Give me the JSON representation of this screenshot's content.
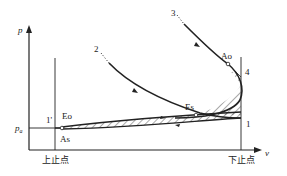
{
  "diagram": {
    "type": "p-v indicator diagram (engine gas exchange)",
    "axes": {
      "y_label": "p",
      "x_label": "v"
    },
    "reference_lines": {
      "pressure_level": "p_a",
      "tdc_label": "上止点",
      "bdc_label": "下止点"
    },
    "curve_labels": {
      "curve_2": "2",
      "curve_3": "3"
    },
    "point_labels": {
      "p1": "1",
      "p1_prime": "1'",
      "p4": "4",
      "exhaust_open": "Eo",
      "exhaust_close": "Es",
      "intake_open": "Ao",
      "intake_close": "As"
    },
    "colors": {
      "line": "#222222",
      "hatch": "#555555",
      "background": "#ffffff"
    }
  }
}
